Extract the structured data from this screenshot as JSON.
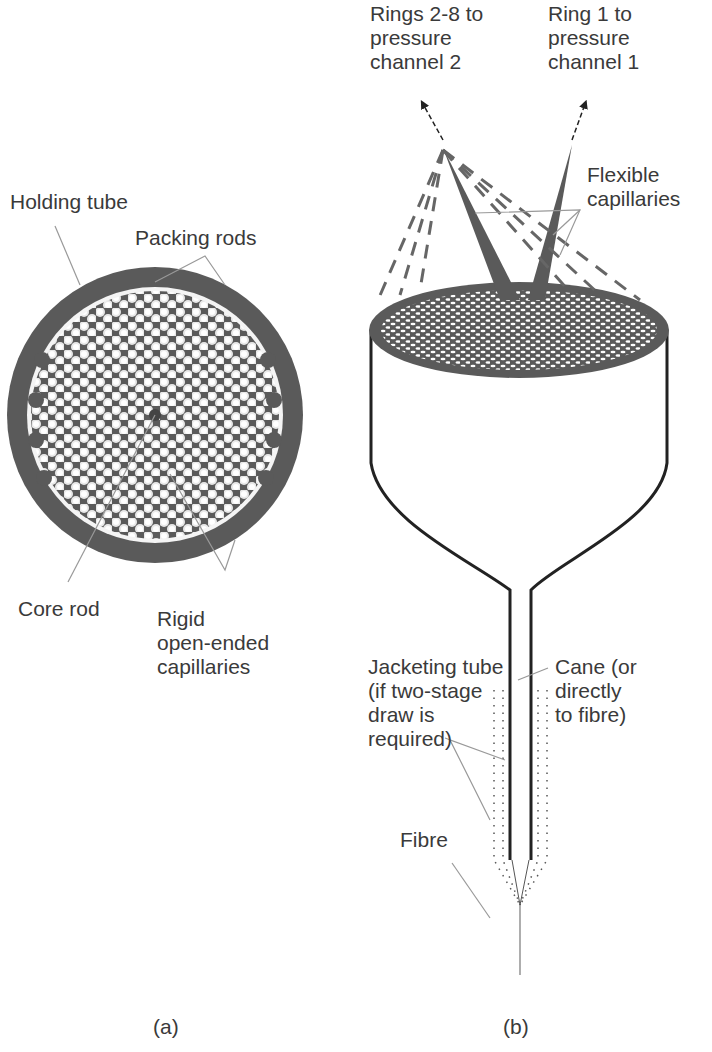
{
  "panel_a": {
    "labels": {
      "holding_tube": "Holding tube",
      "packing_rods": "Packing rods",
      "core_rod": "Core rod",
      "rigid_capillaries": "Rigid\nopen-ended\ncapillaries"
    },
    "caption": "(a)"
  },
  "panel_b": {
    "labels": {
      "rings_2_8": "Rings 2-8 to\npressure\nchannel 2",
      "ring_1": "Ring 1 to\npressure\nchannel 1",
      "flexible_capillaries": "Flexible\ncapillaries",
      "jacketing_tube": "Jacketing tube\n(if two-stage\ndraw is\nrequired)",
      "cane": "Cane (or\ndirectly\nto fibre)",
      "fibre": "Fibre"
    },
    "caption": "(b)"
  },
  "colors": {
    "tube": "#555555",
    "lines": "#222222",
    "leader": "#999999",
    "text": "#3a3a3a"
  }
}
